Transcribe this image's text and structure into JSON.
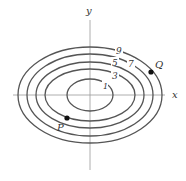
{
  "diagram": {
    "type": "contour",
    "axes": {
      "x_label": "x",
      "y_label": "y"
    },
    "contours": [
      {
        "label": "9",
        "rx": 72,
        "ry": 48
      },
      {
        "label": "7",
        "rx": 63,
        "ry": 41
      },
      {
        "label": "5",
        "rx": 54,
        "ry": 33
      },
      {
        "label": "3",
        "rx": 45,
        "ry": 26
      },
      {
        "label": "1",
        "rx": 23,
        "ry": 16
      }
    ],
    "points": [
      {
        "label": "Q",
        "on_contour": "9"
      },
      {
        "label": "P",
        "on_contour": "3"
      }
    ],
    "colors": {
      "line": "#555555",
      "point": "#111111"
    }
  }
}
